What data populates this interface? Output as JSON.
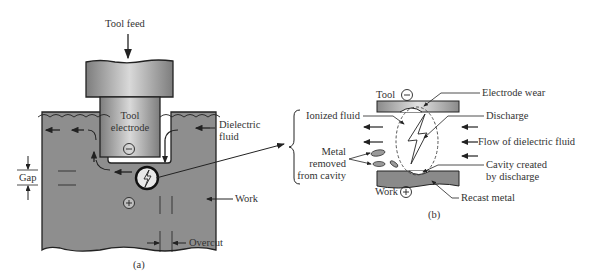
{
  "figure_a": {
    "caption": "(a)",
    "labels": {
      "tool_feed": "Tool feed",
      "tool_electrode_line1": "Tool",
      "tool_electrode_line2": "electrode",
      "dielectric_fluid_line1": "Dielectric",
      "dielectric_fluid_line2": "fluid",
      "gap": "Gap",
      "work": "Work",
      "overcut": "Overcut",
      "tool_polarity": "−",
      "work_polarity": "+"
    }
  },
  "figure_b": {
    "caption": "(b)",
    "labels": {
      "tool": "Tool",
      "tool_polarity": "−",
      "electrode_wear": "Electrode wear",
      "ionized_fluid": "Ionized fluid",
      "discharge": "Discharge",
      "flow_of_dielectric_fluid": "Flow of dielectric fluid",
      "metal_removed_line1": "Metal",
      "metal_removed_line2": "removed",
      "metal_removed_line3": "from cavity",
      "cavity_line1": "Cavity created",
      "cavity_line2": "by discharge",
      "work": "Work",
      "work_polarity": "+",
      "recast_metal": "Recast metal"
    }
  },
  "colors": {
    "work_fill": "#8c8c8c",
    "tool_fill_dark": "#8a8a8a",
    "tool_fill_light": "#d8d8d8",
    "line": "#222222"
  }
}
